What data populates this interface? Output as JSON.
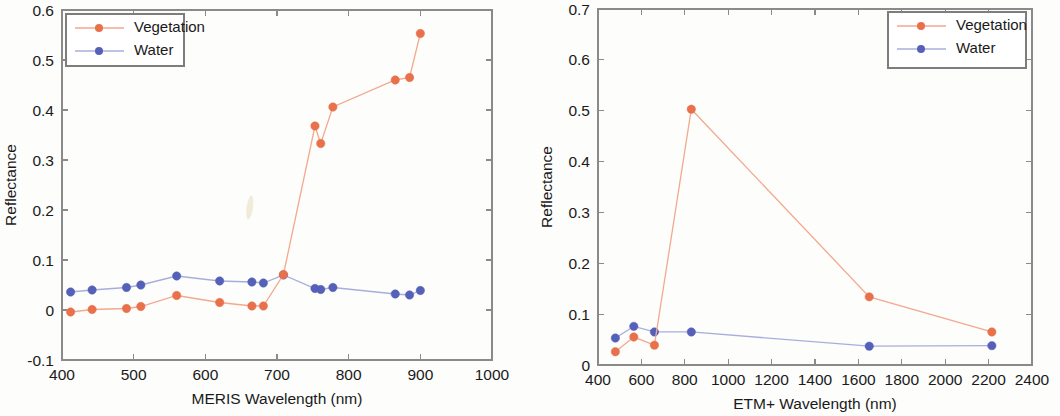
{
  "figure": {
    "panel_count": 2,
    "background": "#fdfdfc"
  },
  "colors": {
    "vegetation": "#e8704a",
    "water": "#5561b8",
    "vegetation_line": "#f2a98e",
    "water_line": "#a8aedb",
    "axis": "#8a8a8a",
    "text": "#1a1a1a"
  },
  "chart_data": [
    {
      "id": "meris",
      "type": "line",
      "title": "",
      "xlabel": "MERIS Wavelength (nm)",
      "ylabel": "Reflectance",
      "xlim": [
        400,
        1000
      ],
      "ylim": [
        -0.1,
        0.6
      ],
      "xticks": [
        400,
        500,
        600,
        700,
        800,
        900,
        1000
      ],
      "xtick_labels": [
        "400",
        "500",
        "600",
        "700",
        "800",
        "900",
        "1000"
      ],
      "yticks": [
        -0.1,
        0,
        0.1,
        0.2,
        0.3,
        0.4,
        0.5,
        0.6
      ],
      "ytick_labels": [
        "-0.1",
        "0",
        "0.1",
        "0.2",
        "0.3",
        "0.4",
        "0.5",
        "0.6"
      ],
      "grid": false,
      "legend_position": "top-left",
      "series": [
        {
          "name": "Vegetation",
          "marker": "filled-circle",
          "x": [
            412,
            442,
            490,
            510,
            560,
            620,
            665,
            681,
            709,
            753,
            761,
            778,
            865,
            885,
            900
          ],
          "y": [
            -0.004,
            0.001,
            0.003,
            0.007,
            0.029,
            0.015,
            0.008,
            0.008,
            0.071,
            0.368,
            0.333,
            0.406,
            0.46,
            0.465,
            0.553
          ]
        },
        {
          "name": "Water",
          "marker": "filled-circle",
          "x": [
            412,
            442,
            490,
            510,
            560,
            620,
            665,
            681,
            709,
            753,
            761,
            778,
            865,
            885,
            900
          ],
          "y": [
            0.036,
            0.04,
            0.045,
            0.05,
            0.068,
            0.058,
            0.056,
            0.054,
            0.07,
            0.043,
            0.041,
            0.045,
            0.032,
            0.03,
            0.039
          ]
        }
      ],
      "artifact": {
        "present": true,
        "note": "faint scan smudge near 660 nm"
      }
    },
    {
      "id": "etm",
      "type": "line",
      "title": "",
      "xlabel": "ETM+ Wavelength (nm)",
      "ylabel": "Reflectance",
      "xlim": [
        400,
        2400
      ],
      "ylim": [
        0,
        0.7
      ],
      "xticks": [
        400,
        600,
        800,
        1000,
        1200,
        1400,
        1600,
        1800,
        2000,
        2200,
        2400
      ],
      "xtick_labels": [
        "400",
        "600",
        "800",
        "1000",
        "1200",
        "1400",
        "1600",
        "1800",
        "2000",
        "2200",
        "2400"
      ],
      "yticks": [
        0,
        0.1,
        0.2,
        0.3,
        0.4,
        0.5,
        0.6,
        0.7
      ],
      "ytick_labels": [
        "0",
        "0.1",
        "0.2",
        "0.3",
        "0.4",
        "0.5",
        "0.6",
        "0.7"
      ],
      "grid": false,
      "legend_position": "top-right",
      "series": [
        {
          "name": "Vegetation",
          "marker": "filled-circle",
          "x": [
            480,
            565,
            660,
            830,
            1650,
            2215
          ],
          "y": [
            0.026,
            0.055,
            0.039,
            0.503,
            0.134,
            0.065
          ]
        },
        {
          "name": "Water",
          "marker": "filled-circle",
          "x": [
            480,
            565,
            660,
            830,
            1650,
            2215
          ],
          "y": [
            0.053,
            0.076,
            0.065,
            0.065,
            0.037,
            0.038
          ]
        }
      ],
      "artifact": {
        "present": false,
        "note": ""
      }
    }
  ]
}
